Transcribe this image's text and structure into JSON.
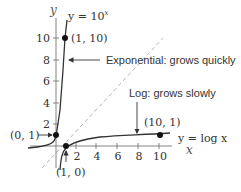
{
  "axes": {
    "x_label": "x",
    "y_label": "y",
    "x_ticks": [
      "2",
      "4",
      "6",
      "8",
      "10"
    ],
    "y_ticks": [
      "2",
      "4",
      "6",
      "8",
      "10"
    ]
  },
  "curves": {
    "exp_label_base": "y = 10",
    "exp_label_sup": "x",
    "log_label": "y = log x"
  },
  "points": {
    "p_1_10": "(1, 10)",
    "p_0_1": "(0, 1)",
    "p_1_0": "(1, 0)",
    "p_10_1": "(10, 1)"
  },
  "annotations": {
    "exp": "Exponential: grows quickly",
    "log": "Log: grows slowly"
  },
  "colors": {
    "curve": "#333333",
    "dashed": "#aaaaaa",
    "text": "#333333"
  }
}
